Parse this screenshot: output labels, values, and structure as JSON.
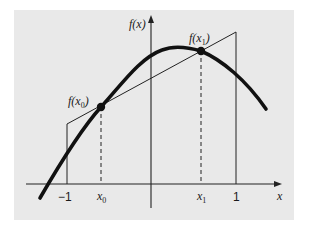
{
  "diagram": {
    "type": "function-plot-gauss-legendre-two-point",
    "background_color": "#e9e9e9",
    "curve_color": "#111111",
    "line_color": "#222222",
    "axes": {
      "x_label": "x",
      "y_label": "f(x)"
    },
    "tick_labels": {
      "neg_one": "−1",
      "x0": "x",
      "x0_sub": "0",
      "x1": "x",
      "x1_sub": "1",
      "one": "1"
    },
    "point_labels": {
      "f_x0_prefix": "f(x",
      "f_x0_sub": "0",
      "f_x0_suffix": ")",
      "f_x1_prefix": "f(x",
      "f_x1_sub": "1",
      "f_x1_suffix": ")"
    },
    "elements": [
      "thick concave-down curve f(x)",
      "secant line through f(x0) and f(x1) extended to x=-1 and x=1",
      "vertical lines at x=-1 and x=1 forming a trapezoid",
      "dashed verticals from x0 and x1 up to the curve",
      "filled dots at (x0, f(x0)) and (x1, f(x1))"
    ]
  }
}
